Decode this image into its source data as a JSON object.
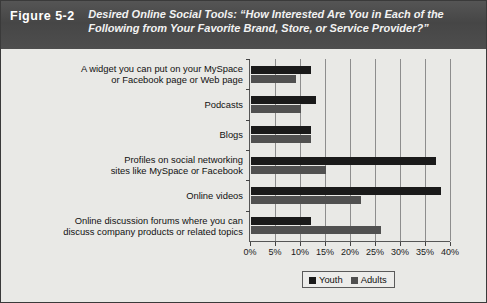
{
  "figure": {
    "label": "Figure 5-2",
    "title_lines": [
      "Desired Online Social Tools: “How Interested Are You in Each of the",
      "Following from Your Favorite Brand, Store, or Service Provider?”"
    ],
    "title_full": "Desired Online Social Tools: “How Interested Are You in Each of the Following from Your Favorite Brand, Store, or Service Provider?”"
  },
  "legend": {
    "position": "bottom",
    "entries": [
      {
        "label": "Youth",
        "color": "#1a1a1a"
      },
      {
        "label": "Adults",
        "color": "#4f4f4f"
      }
    ]
  },
  "chart_data": {
    "type": "bar",
    "orientation": "horizontal",
    "title": "Desired Online Social Tools: “How Interested Are You in Each of the Following from Your Favorite Brand, Store, or Service Provider?”",
    "xlabel": "",
    "ylabel": "",
    "xlim": [
      0,
      40
    ],
    "xticks": [
      0,
      5,
      10,
      15,
      20,
      25,
      30,
      35,
      40
    ],
    "xtick_labels": [
      "0%",
      "5%",
      "10%",
      "15%",
      "20%",
      "25%",
      "30%",
      "35%",
      "40%"
    ],
    "grid": true,
    "categories": [
      "A widget you can put on your MySpace or Facebook page or Web page",
      "Podcasts",
      "Blogs",
      "Profiles on social networking sites like MySpace or Facebook",
      "Online videos",
      "Online discussion forums where you can discuss company products or related topics"
    ],
    "category_lines": [
      [
        "A widget you can put on your MySpace",
        "or Facebook page or Web page"
      ],
      [
        "Podcasts"
      ],
      [
        "Blogs"
      ],
      [
        "Profiles on social networking",
        "sites like MySpace or Facebook"
      ],
      [
        "Online videos"
      ],
      [
        "Online discussion forums where you can",
        "discuss company products or related topics"
      ]
    ],
    "series": [
      {
        "name": "Youth",
        "color": "#1a1a1a",
        "values": [
          12,
          13,
          12,
          37,
          38,
          12
        ]
      },
      {
        "name": "Adults",
        "color": "#505050",
        "values": [
          9,
          10,
          12,
          15,
          22,
          26
        ]
      }
    ]
  }
}
